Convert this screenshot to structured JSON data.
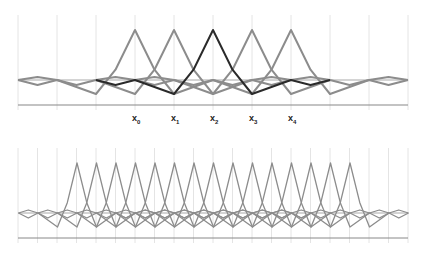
{
  "top_panel": {
    "labels": [
      "x0",
      "x1",
      "x2",
      "x3",
      "x4"
    ],
    "label_base": "x",
    "label_subs": [
      "0",
      "1",
      "2",
      "3",
      "4"
    ],
    "node_x": [
      135,
      174,
      213,
      252,
      291
    ],
    "gridlines_x": [
      18,
      57,
      96,
      135,
      174,
      213,
      252,
      291,
      330,
      369,
      408
    ],
    "baseline_y": 80,
    "peak_y": 30,
    "trough_y": 94,
    "axis_y": 105,
    "highlight_node_index": 2
  },
  "bottom_panel": {
    "gridline_spacing": 19.5,
    "gridline_start": 18,
    "gridline_count": 21,
    "peak_start_x": 77,
    "peak_count": 15,
    "baseline_y": 213,
    "peak_y": 163,
    "trough_y": 227,
    "axis_y": 238
  },
  "colors": {
    "grid": "#dddddd",
    "curve": "#8c8c8c",
    "highlight": "#2a2a2a",
    "axis": "#888888"
  }
}
